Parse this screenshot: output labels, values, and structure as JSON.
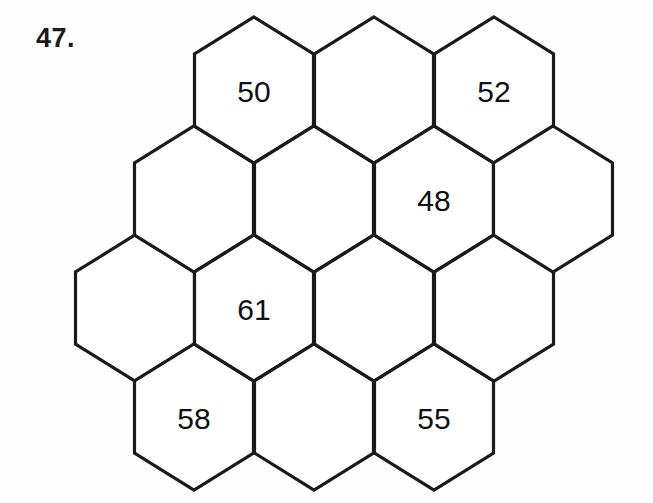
{
  "worksheet": {
    "problem_number": "47.",
    "puzzle_type": "hexagon-number-grid",
    "background_color": "#fefefe",
    "line_color": "#1a1a1a",
    "text_color": "#111111"
  },
  "grid": {
    "description": "Honeycomb of pointy-top hexagons sharing vertical edges",
    "hex_width": 119,
    "hex_side": 72,
    "hex_apex": 37,
    "column_step_x": 60,
    "column_offset_y": 109,
    "cells": [
      {
        "col": 0,
        "row": 0,
        "cx": 135,
        "cy": 308,
        "value": ""
      },
      {
        "col": 1,
        "row": 0,
        "cx": 194,
        "cy": 199,
        "value": ""
      },
      {
        "col": 1,
        "row": 1,
        "cx": 194,
        "cy": 417,
        "value": "58"
      },
      {
        "col": 2,
        "row": 0,
        "cx": 254,
        "cy": 90,
        "value": "50"
      },
      {
        "col": 2,
        "row": 1,
        "cx": 254,
        "cy": 308,
        "value": "61"
      },
      {
        "col": 3,
        "row": 0,
        "cx": 314,
        "cy": 199,
        "value": ""
      },
      {
        "col": 3,
        "row": 1,
        "cx": 314,
        "cy": 417,
        "value": ""
      },
      {
        "col": 4,
        "row": 0,
        "cx": 374,
        "cy": 90,
        "value": ""
      },
      {
        "col": 4,
        "row": 1,
        "cx": 374,
        "cy": 308,
        "value": ""
      },
      {
        "col": 5,
        "row": 0,
        "cx": 434,
        "cy": 199,
        "value": "48"
      },
      {
        "col": 5,
        "row": 1,
        "cx": 434,
        "cy": 417,
        "value": "55"
      },
      {
        "col": 6,
        "row": 0,
        "cx": 494,
        "cy": 90,
        "value": "52"
      },
      {
        "col": 6,
        "row": 1,
        "cx": 494,
        "cy": 308,
        "value": ""
      },
      {
        "col": 7,
        "row": 0,
        "cx": 553,
        "cy": 199,
        "value": ""
      }
    ],
    "filled_values": [
      "50",
      "52",
      "48",
      "61",
      "58",
      "55"
    ]
  }
}
